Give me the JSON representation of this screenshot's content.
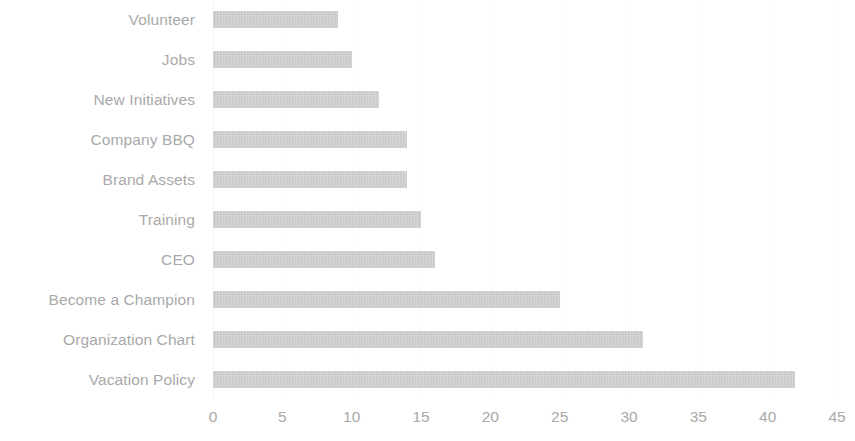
{
  "chart_data": {
    "type": "bar",
    "orientation": "horizontal",
    "title": "",
    "subtitle": "",
    "xlabel": "",
    "ylabel": "",
    "xlim": [
      0,
      45
    ],
    "xticks": [
      0,
      5,
      10,
      15,
      20,
      25,
      30,
      35,
      40,
      45
    ],
    "xtick_labels": [
      "0",
      "5",
      "10",
      "15",
      "20",
      "25",
      "30",
      "35",
      "40",
      "45"
    ],
    "grid": true,
    "legend": false,
    "legend_position": "none",
    "bar_color": "#c9c9c9",
    "label_color": "#a9a9a9",
    "gridline_color": "#fbfbfb",
    "categories": [
      "Volunteer",
      "Jobs",
      "New Initiatives",
      "Company BBQ",
      "Brand Assets",
      "Training",
      "CEO",
      "Become a Champion",
      "Organization Chart",
      "Vacation Policy"
    ],
    "values": [
      9,
      10,
      12,
      14,
      14,
      15,
      16,
      25,
      31,
      42
    ]
  }
}
